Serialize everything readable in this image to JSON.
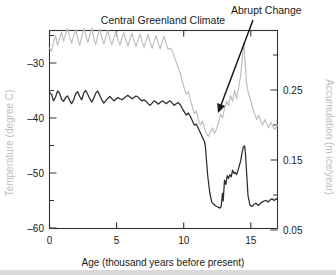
{
  "figure": {
    "title": "Central Greenland Climate",
    "annotation": {
      "label": "Abrupt Change",
      "text_x": 231,
      "text_y": 14,
      "arrow_from_x": 253,
      "arrow_from_y": 20,
      "arrow_to_x": 218,
      "arrow_to_y": 113
    }
  },
  "chart_data": {
    "type": "line",
    "title": "Central Greenland Climate",
    "xlabel": "Age (thousand years before present)",
    "xlim": [
      0,
      17
    ],
    "xticks": [
      0,
      5,
      10,
      15
    ],
    "xtick_labels": [
      "0",
      "5",
      "10",
      "15"
    ],
    "grid": false,
    "legend": "none",
    "annotations": [
      {
        "text": "Abrupt Change",
        "points_to_x": 12.1,
        "points_to_y_temp": -43.5,
        "description": "arrow pointing to the abrupt warming transition near 11.7 thousand years before present"
      }
    ],
    "axes": [
      {
        "side": "left",
        "ylabel": "Temperature (degree C)",
        "ylim": [
          -62,
          -26
        ],
        "yticks": [
          -30,
          -40,
          -50,
          -60
        ],
        "ytick_labels": [
          "–30",
          "–40",
          "–50",
          "–60"
        ],
        "minor_yticks": [
          -35,
          -45,
          -55
        ],
        "label_color": "#bdbdbd",
        "series_color": "#2b2b2b"
      },
      {
        "side": "right",
        "ylabel": "Accumulation (m ice/year)",
        "ylim": [
          0.0143,
          0.2971
        ],
        "yticks": [
          0.25,
          0.15,
          0.05
        ],
        "ytick_labels": [
          "0.25",
          "0.15",
          "0.05"
        ],
        "minor_yticks": [
          0.2,
          0.1,
          0.3
        ],
        "label_color": "#bdbdbd",
        "series_color": "#bdbdbd"
      }
    ],
    "series": [
      {
        "name": "Temperature",
        "axis": "left",
        "units": "degree C",
        "color": "#2b2b2b",
        "x": [
          0.0,
          0.15,
          0.3,
          0.45,
          0.6,
          0.75,
          0.9,
          1.05,
          1.2,
          1.35,
          1.5,
          1.65,
          1.8,
          1.95,
          2.1,
          2.25,
          2.4,
          2.55,
          2.7,
          2.85,
          3.0,
          3.15,
          3.3,
          3.45,
          3.6,
          3.75,
          3.9,
          4.05,
          4.2,
          4.35,
          4.5,
          4.65,
          4.8,
          4.95,
          5.1,
          5.25,
          5.4,
          5.55,
          5.7,
          5.85,
          6.0,
          6.15,
          6.3,
          6.45,
          6.6,
          6.75,
          6.9,
          7.05,
          7.2,
          7.35,
          7.5,
          7.65,
          7.8,
          7.95,
          8.1,
          8.25,
          8.4,
          8.55,
          8.7,
          8.85,
          9.0,
          9.15,
          9.3,
          9.45,
          9.6,
          9.75,
          9.9,
          10.05,
          10.2,
          10.35,
          10.5,
          10.65,
          10.8,
          10.95,
          11.1,
          11.25,
          11.4,
          11.55,
          11.62,
          11.7,
          11.8,
          11.95,
          12.1,
          12.25,
          12.4,
          12.55,
          12.7,
          12.8,
          12.9,
          12.95,
          13.05,
          13.15,
          13.25,
          13.35,
          13.45,
          13.55,
          13.65,
          13.75,
          13.85,
          13.95,
          14.05,
          14.15,
          14.25,
          14.35,
          14.45,
          14.55,
          14.62,
          14.7,
          14.8,
          14.95,
          15.1,
          15.25,
          15.4,
          15.55,
          15.7,
          15.85,
          16.0,
          16.15,
          16.3,
          16.45,
          16.6,
          16.75,
          16.9,
          17.0
        ],
        "y": [
          -37.2,
          -37.6,
          -38.8,
          -38.1,
          -37.0,
          -37.4,
          -38.5,
          -38.9,
          -38.2,
          -37.9,
          -38.7,
          -39.3,
          -38.6,
          -37.5,
          -37.1,
          -38.0,
          -38.6,
          -37.4,
          -36.9,
          -37.6,
          -38.4,
          -39.0,
          -38.3,
          -37.4,
          -37.0,
          -37.8,
          -38.6,
          -39.2,
          -38.8,
          -38.3,
          -38.0,
          -38.4,
          -38.8,
          -38.5,
          -38.2,
          -38.4,
          -38.6,
          -38.3,
          -38.0,
          -37.8,
          -38.1,
          -38.4,
          -38.2,
          -37.9,
          -38.1,
          -38.5,
          -38.8,
          -38.6,
          -38.9,
          -39.3,
          -39.6,
          -39.2,
          -38.8,
          -39.0,
          -39.4,
          -39.1,
          -38.8,
          -39.0,
          -39.3,
          -39.0,
          -38.8,
          -39.2,
          -39.6,
          -39.3,
          -39.1,
          -39.5,
          -40.2,
          -40.8,
          -41.4,
          -41.0,
          -41.6,
          -42.4,
          -43.2,
          -43.0,
          -43.8,
          -44.6,
          -45.4,
          -46.2,
          -47.0,
          -49.5,
          -52.5,
          -55.5,
          -57.2,
          -57.6,
          -57.9,
          -58.1,
          -58.3,
          -58.0,
          -55.6,
          -57.0,
          -53.2,
          -54.0,
          -52.4,
          -52.9,
          -52.2,
          -52.6,
          -51.4,
          -52.0,
          -51.8,
          -52.2,
          -51.5,
          -50.6,
          -49.8,
          -48.3,
          -47.2,
          -47.0,
          -48.6,
          -52.0,
          -56.0,
          -57.8,
          -58.0,
          -57.6,
          -57.4,
          -57.8,
          -57.5,
          -57.2,
          -57.0,
          -56.9,
          -57.2,
          -56.8,
          -56.6,
          -56.9,
          -56.6,
          -56.8
        ]
      },
      {
        "name": "Accumulation",
        "axis": "right",
        "units": "m ice/year",
        "color": "#bdbdbd",
        "x": [
          0.0,
          0.15,
          0.3,
          0.45,
          0.6,
          0.75,
          0.9,
          1.05,
          1.2,
          1.35,
          1.5,
          1.65,
          1.8,
          1.95,
          2.1,
          2.25,
          2.4,
          2.55,
          2.7,
          2.85,
          3.0,
          3.15,
          3.3,
          3.45,
          3.6,
          3.75,
          3.9,
          4.05,
          4.2,
          4.35,
          4.5,
          4.65,
          4.8,
          4.95,
          5.1,
          5.25,
          5.4,
          5.55,
          5.7,
          5.85,
          6.0,
          6.15,
          6.3,
          6.45,
          6.6,
          6.75,
          6.9,
          7.05,
          7.2,
          7.35,
          7.5,
          7.65,
          7.8,
          7.95,
          8.1,
          8.25,
          8.4,
          8.55,
          8.7,
          8.85,
          9.0,
          9.15,
          9.3,
          9.45,
          9.6,
          9.75,
          9.9,
          10.05,
          10.2,
          10.35,
          10.5,
          10.65,
          10.8,
          10.95,
          11.1,
          11.25,
          11.4,
          11.55,
          11.7,
          11.85,
          12.0,
          12.15,
          12.3,
          12.45,
          12.6,
          12.75,
          12.9,
          13.05,
          13.2,
          13.35,
          13.5,
          13.65,
          13.8,
          13.95,
          14.1,
          14.25,
          14.4,
          14.5,
          14.6,
          14.7,
          14.85,
          15.0,
          15.15,
          15.3,
          15.45,
          15.6,
          15.75,
          15.9,
          16.05,
          16.2,
          16.35,
          16.5,
          16.65,
          16.8,
          17.0
        ],
        "y": [
          0.272,
          0.268,
          0.28,
          0.29,
          0.276,
          0.286,
          0.295,
          0.282,
          0.292,
          0.3,
          0.288,
          0.279,
          0.29,
          0.298,
          0.286,
          0.276,
          0.288,
          0.3,
          0.291,
          0.28,
          0.289,
          0.301,
          0.286,
          0.277,
          0.29,
          0.299,
          0.287,
          0.278,
          0.288,
          0.297,
          0.285,
          0.277,
          0.287,
          0.296,
          0.284,
          0.276,
          0.286,
          0.294,
          0.283,
          0.275,
          0.285,
          0.293,
          0.282,
          0.274,
          0.284,
          0.292,
          0.281,
          0.273,
          0.283,
          0.291,
          0.28,
          0.272,
          0.282,
          0.29,
          0.279,
          0.271,
          0.281,
          0.289,
          0.278,
          0.27,
          0.272,
          0.268,
          0.26,
          0.252,
          0.244,
          0.236,
          0.225,
          0.214,
          0.206,
          0.21,
          0.198,
          0.188,
          0.178,
          0.182,
          0.17,
          0.162,
          0.168,
          0.158,
          0.15,
          0.146,
          0.152,
          0.158,
          0.15,
          0.156,
          0.166,
          0.178,
          0.172,
          0.186,
          0.196,
          0.19,
          0.204,
          0.196,
          0.212,
          0.2,
          0.216,
          0.232,
          0.262,
          0.28,
          0.248,
          0.22,
          0.206,
          0.198,
          0.186,
          0.178,
          0.17,
          0.176,
          0.168,
          0.162,
          0.17,
          0.164,
          0.158,
          0.166,
          0.16,
          0.156,
          0.162
        ]
      }
    ]
  },
  "footer": {
    "band_color": "#d9d9d9"
  }
}
